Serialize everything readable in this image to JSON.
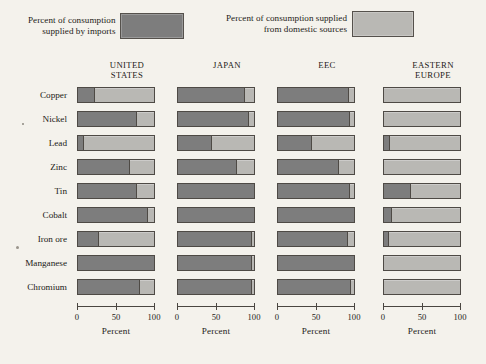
{
  "legend": {
    "items": [
      {
        "label_line1": "Percent of consumption",
        "label_line2": "supplied by imports",
        "color": "#7d7d7d",
        "key": "imports"
      },
      {
        "label_line1": "Percent of consumption supplied",
        "label_line2": "from domestic sources",
        "color": "#b9b8b4",
        "key": "domestic"
      }
    ]
  },
  "chart_data": {
    "type": "bar",
    "title": "",
    "subtitle": "",
    "orientation": "horizontal",
    "stacked": true,
    "stack_total": 100,
    "xlabel": "Percent",
    "ylabel": "",
    "xlim": [
      0,
      100
    ],
    "xticks": [
      0,
      50,
      100
    ],
    "xticklabels": [
      "0",
      "50",
      "100"
    ],
    "grid": false,
    "legend_position": "top",
    "categories": [
      "Copper",
      "Nickel",
      "Lead",
      "Zinc",
      "Tin",
      "Cobalt",
      "Iron ore",
      "Manganese",
      "Chromium"
    ],
    "panels": [
      {
        "name": "UNITED STATES",
        "title_line1": "UNITED",
        "title_line2": "STATES",
        "series": [
          {
            "name": "Percent of consumption supplied by imports",
            "key": "imports",
            "color": "#7d7d7d",
            "values": [
              22,
              78,
              8,
              68,
              78,
              92,
              28,
              100,
              82
            ]
          },
          {
            "name": "Percent of consumption supplied from domestic sources",
            "key": "domestic",
            "color": "#b9b8b4",
            "values": [
              78,
              22,
              92,
              32,
              22,
              8,
              72,
              0,
              18
            ]
          }
        ]
      },
      {
        "name": "JAPAN",
        "title_line1": "JAPAN",
        "title_line2": "",
        "series": [
          {
            "name": "Percent of consumption supplied by imports",
            "key": "imports",
            "color": "#7d7d7d",
            "values": [
              88,
              93,
              45,
              78,
              100,
              100,
              97,
              97,
              98
            ]
          },
          {
            "name": "Percent of consumption supplied from domestic sources",
            "key": "domestic",
            "color": "#b9b8b4",
            "values": [
              12,
              7,
              55,
              22,
              0,
              0,
              3,
              3,
              2
            ]
          }
        ]
      },
      {
        "name": "EEC",
        "title_line1": "EEC",
        "title_line2": "",
        "series": [
          {
            "name": "Percent of consumption supplied by imports",
            "key": "imports",
            "color": "#7d7d7d",
            "values": [
              93,
              95,
              45,
              80,
              95,
              100,
              92,
              100,
              96
            ]
          },
          {
            "name": "Percent of consumption supplied from domestic sources",
            "key": "domestic",
            "color": "#b9b8b4",
            "values": [
              7,
              5,
              55,
              20,
              5,
              0,
              8,
              0,
              4
            ]
          }
        ]
      },
      {
        "name": "EASTERN EUROPE",
        "title_line1": "EASTERN",
        "title_line2": "EUROPE",
        "series": [
          {
            "name": "Percent of consumption supplied by imports",
            "key": "imports",
            "color": "#7d7d7d",
            "values": [
              0,
              0,
              8,
              0,
              35,
              10,
              6,
              0,
              0
            ]
          },
          {
            "name": "Percent of consumption supplied from domestic sources",
            "key": "domestic",
            "color": "#b9b8b4",
            "values": [
              100,
              100,
              92,
              100,
              65,
              90,
              94,
              100,
              100
            ]
          }
        ]
      }
    ]
  }
}
